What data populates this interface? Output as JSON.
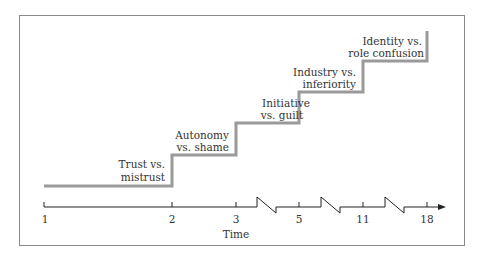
{
  "diagram": {
    "title": "",
    "stages": [
      {
        "line1": "Trust vs.",
        "line2": "mistrust"
      },
      {
        "line1": "Autonomy",
        "line2": "vs. shame"
      },
      {
        "line1": "Initiative",
        "line2": "vs. guilt"
      },
      {
        "line1": "Industry vs.",
        "line2": "inferiority"
      },
      {
        "line1": "Identity vs.",
        "line2": "role confusion"
      }
    ],
    "axis": {
      "label": "Time",
      "ticks": [
        "1",
        "2",
        "3",
        "5",
        "11",
        "18"
      ]
    },
    "colors": {
      "step_line": "#9a9a9a",
      "axis": "#222222",
      "frame": "#8a8a8a"
    }
  }
}
